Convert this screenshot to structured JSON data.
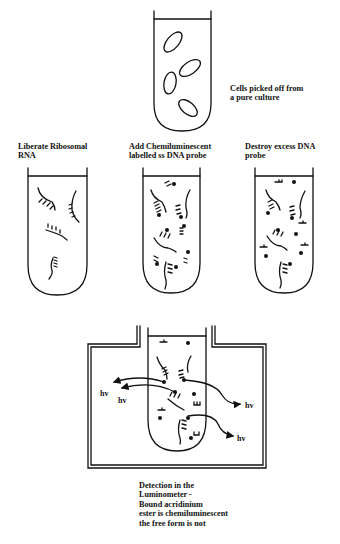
{
  "diagram": {
    "type": "process-flow",
    "steps": [
      {
        "id": "cells",
        "label_lines": [
          "Cells picked off from",
          "a pure culture"
        ],
        "tube_contents": "4 oval cells"
      },
      {
        "id": "liberate",
        "label_lines": [
          "Liberate Ribosomal",
          "RNA"
        ],
        "tube_contents": "4 rRNA strands"
      },
      {
        "id": "add-probe",
        "label_lines": [
          "Add Chemiluminescent",
          "labelled ss DNA probe"
        ],
        "tube_contents": "rRNA hybridized with labelled probes plus excess probe"
      },
      {
        "id": "destroy",
        "label_lines": [
          "Destroy excess DNA",
          "probe"
        ],
        "tube_contents": "hybrids plus free label dots and probe fragments"
      },
      {
        "id": "detect",
        "label_lines": [
          "Detection in the",
          "Luminometer -",
          "Bound acridinium",
          "ester is chemiluminescent",
          "the free form is not"
        ],
        "tube_contents": "hybrids emitting light"
      }
    ],
    "emission_label": "hv",
    "emission_count": 4
  },
  "colors": {
    "ink": "#111111",
    "background": "#ffffff"
  }
}
